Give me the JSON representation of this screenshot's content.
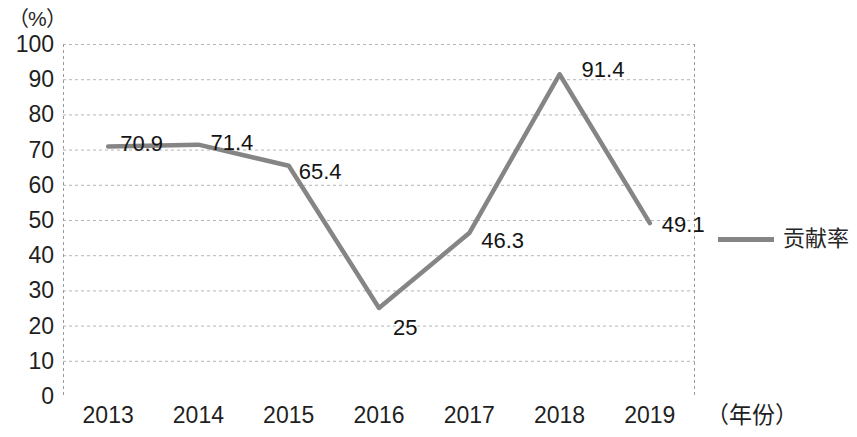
{
  "chart_data": {
    "type": "line",
    "title": "",
    "subtitle": "",
    "xlabel": "（年份）",
    "ylabel": "（%）",
    "categories": [
      "2013",
      "2014",
      "2015",
      "2016",
      "2017",
      "2018",
      "2019"
    ],
    "series": [
      {
        "name": "贡献率",
        "color": "#858585",
        "values": [
          70.9,
          71.4,
          65.4,
          25,
          46.3,
          91.4,
          49.1
        ],
        "labels": [
          "70.9",
          "71.4",
          "65.4",
          "25",
          "46.3",
          "91.4",
          "49.1"
        ]
      }
    ],
    "ylim": [
      0,
      100
    ],
    "ytick_values": [
      100,
      90,
      80,
      70,
      60,
      50,
      40,
      30,
      20,
      10,
      0
    ],
    "ytick_labels": [
      "100",
      "90",
      "80",
      "70",
      "60",
      "50",
      "40",
      "30",
      "20",
      "10",
      "0"
    ],
    "grid": true,
    "grid_axis": "y",
    "grid_color": "#b5b5b5",
    "grid_style": "dashed",
    "legend_position": "right",
    "legend_entries": [
      "贡献率"
    ],
    "markers": false,
    "axis_color": "#9a9a9a"
  },
  "legend": {
    "entry_label": "贡献率"
  },
  "axes": {
    "y_unit_label": "（%）",
    "x_axis_title": "（年份）"
  }
}
